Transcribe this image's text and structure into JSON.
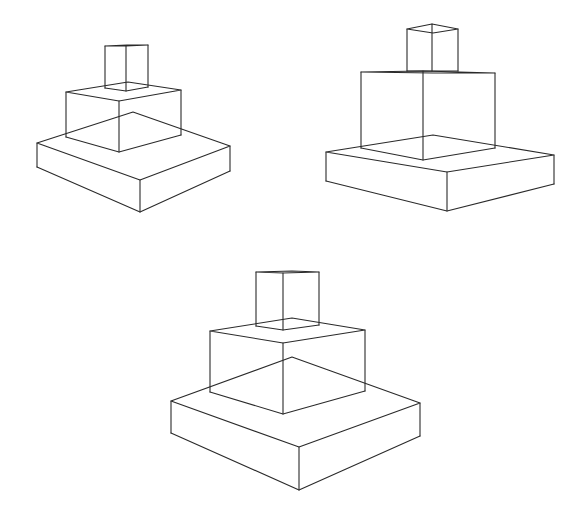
{
  "canvas": {
    "width": 581,
    "height": 519,
    "background": "#ffffff",
    "stroke": "#2a2a2a"
  },
  "figures": [
    {
      "name": "stacked-boxes-left",
      "boxes": [
        {
          "name": "base-slab",
          "lt": [
            37,
            143
          ],
          "ft": [
            140,
            180
          ],
          "rt": [
            230,
            146
          ],
          "bt": [
            133,
            112
          ],
          "lb": [
            37,
            167
          ],
          "fb": [
            140,
            212
          ],
          "rb": [
            230,
            171
          ]
        },
        {
          "name": "middle-block",
          "lt": [
            66,
            92
          ],
          "ft": [
            119,
            101
          ],
          "rt": [
            181,
            90
          ],
          "bt": [
            128,
            82
          ],
          "lb": [
            66,
            137
          ],
          "fb": [
            119,
            152
          ],
          "rb": [
            181,
            135
          ]
        },
        {
          "name": "top-cube",
          "lt": [
            105,
            46
          ],
          "ft": [
            126,
            46
          ],
          "rt": [
            148,
            45
          ],
          "bt": [
            127,
            45
          ],
          "lb": [
            105,
            88
          ],
          "fb": [
            126,
            91
          ],
          "rb": [
            148,
            87
          ]
        }
      ]
    },
    {
      "name": "stacked-boxes-right",
      "boxes": [
        {
          "name": "base-slab",
          "lt": [
            326,
            152
          ],
          "ft": [
            447,
            172
          ],
          "rt": [
            554,
            155
          ],
          "bt": [
            433,
            135
          ],
          "lb": [
            326,
            181
          ],
          "fb": [
            447,
            211
          ],
          "rb": [
            554,
            184
          ]
        },
        {
          "name": "middle-block",
          "lt": [
            361,
            72
          ],
          "ft": [
            423,
            71
          ],
          "rt": [
            495,
            73
          ],
          "bt": [
            433,
            73
          ],
          "lb": [
            361,
            148
          ],
          "fb": [
            423,
            160
          ],
          "rb": [
            495,
            148
          ]
        },
        {
          "name": "top-cube",
          "lt": [
            407,
            29
          ],
          "ft": [
            432,
            24
          ],
          "rt": [
            458,
            29
          ],
          "bt": [
            433,
            33
          ],
          "lb": [
            407,
            71
          ],
          "fb": [
            432,
            71
          ],
          "rb": [
            458,
            71
          ]
        }
      ]
    },
    {
      "name": "stacked-boxes-bottom",
      "boxes": [
        {
          "name": "base-slab",
          "lt": [
            171,
            401
          ],
          "ft": [
            299,
            447
          ],
          "rt": [
            420,
            403
          ],
          "bt": [
            292,
            357
          ],
          "lb": [
            171,
            433
          ],
          "fb": [
            299,
            490
          ],
          "rb": [
            420,
            436
          ]
        },
        {
          "name": "middle-block",
          "lt": [
            210,
            331
          ],
          "ft": [
            283,
            343
          ],
          "rt": [
            365,
            330
          ],
          "bt": [
            292,
            318
          ],
          "lb": [
            210,
            392
          ],
          "fb": [
            283,
            414
          ],
          "rb": [
            365,
            391
          ]
        },
        {
          "name": "top-cube",
          "lt": [
            256,
            272
          ],
          "ft": [
            283,
            273
          ],
          "rt": [
            319,
            272
          ],
          "bt": [
            292,
            271
          ],
          "lb": [
            256,
            326
          ],
          "fb": [
            283,
            330
          ],
          "rb": [
            319,
            325
          ]
        }
      ]
    }
  ]
}
